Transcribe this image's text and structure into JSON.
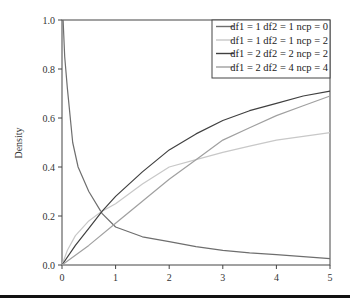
{
  "chart_data": {
    "type": "line",
    "title": "",
    "xlabel": "",
    "ylabel": "Density",
    "xlim": [
      0,
      5
    ],
    "ylim": [
      0,
      1.0
    ],
    "x_ticks": [
      "0",
      "1",
      "2",
      "3",
      "4",
      "5"
    ],
    "y_ticks": [
      "0.0",
      "0.2",
      "0.4",
      "0.6",
      "0.8",
      "1.0"
    ],
    "grid": false,
    "legend_position": "top-right",
    "series": [
      {
        "name": "df1 = 1 df2 = 1 ncp = 0",
        "color": "#6e6e6e",
        "x": [
          0.02,
          0.05,
          0.1,
          0.2,
          0.3,
          0.5,
          0.75,
          1,
          1.5,
          2,
          2.5,
          3,
          3.5,
          4,
          4.5,
          5
        ],
        "y": [
          1.0,
          0.85,
          0.72,
          0.5,
          0.4,
          0.3,
          0.21,
          0.155,
          0.115,
          0.095,
          0.075,
          0.06,
          0.05,
          0.042,
          0.034,
          0.026
        ]
      },
      {
        "name": "df1 = 1 df2 = 1 ncp = 2",
        "color": "#c8c8c8",
        "x": [
          0,
          0.1,
          0.25,
          0.5,
          0.75,
          1,
          1.5,
          2,
          2.5,
          3,
          3.5,
          4,
          4.5,
          5
        ],
        "y": [
          0,
          0.06,
          0.12,
          0.18,
          0.22,
          0.25,
          0.33,
          0.4,
          0.43,
          0.46,
          0.485,
          0.51,
          0.525,
          0.54
        ]
      },
      {
        "name": "df1 = 2 df2 = 2 ncp = 2",
        "color": "#404040",
        "x": [
          0,
          0.25,
          0.5,
          0.75,
          1,
          1.5,
          2,
          2.5,
          3,
          3.5,
          4,
          4.5,
          5
        ],
        "y": [
          0,
          0.08,
          0.15,
          0.22,
          0.28,
          0.38,
          0.47,
          0.535,
          0.59,
          0.63,
          0.66,
          0.69,
          0.71
        ]
      },
      {
        "name": "df1 = 2 df2 = 4 ncp = 4",
        "color": "#a0a0a0",
        "x": [
          0,
          0.5,
          1,
          1.5,
          2,
          2.5,
          3,
          3.5,
          4,
          4.5,
          5
        ],
        "y": [
          0,
          0.08,
          0.17,
          0.26,
          0.35,
          0.43,
          0.51,
          0.56,
          0.61,
          0.65,
          0.69
        ]
      }
    ]
  },
  "legend": {
    "items": [
      {
        "label": "df1 = 1 df2 = 1 ncp = 0",
        "color": "#6e6e6e"
      },
      {
        "label": "df1 = 1 df2 = 1 ncp = 2",
        "color": "#c8c8c8"
      },
      {
        "label": "df1 = 2 df2 = 2 ncp = 2",
        "color": "#404040"
      },
      {
        "label": "df1 = 2 df2 = 4 ncp = 4",
        "color": "#a0a0a0"
      }
    ]
  }
}
